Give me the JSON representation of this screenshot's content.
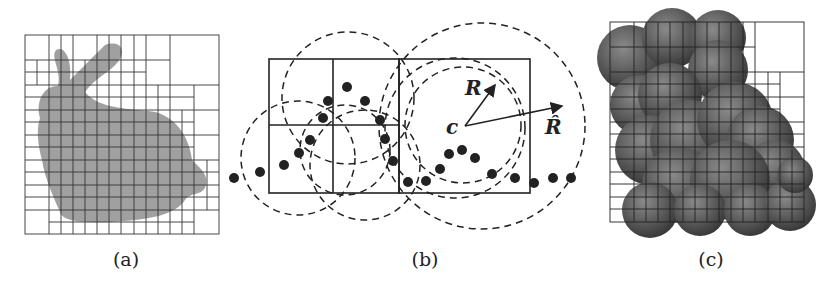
{
  "figure": {
    "panels": [
      {
        "id": "a",
        "caption": "(a)",
        "description": "Stanford bunny point cloud subdivided by adaptive octree grid"
      },
      {
        "id": "b",
        "caption": "(b)",
        "description": "2D schematic of points, quadtree cells and bounding spheres with center c, radii R and R-hat"
      },
      {
        "id": "c",
        "caption": "(c)",
        "description": "Sphere-set approximation of bunny overlaid on adaptive grid"
      }
    ],
    "panel_b_labels": {
      "center": "c",
      "inner_radius": "R",
      "outer_radius": "R̂"
    },
    "colors": {
      "line": "#222222",
      "point": "#222222",
      "bunny_fill": "#8a8a8a",
      "sphere_fill": "#555555"
    }
  }
}
